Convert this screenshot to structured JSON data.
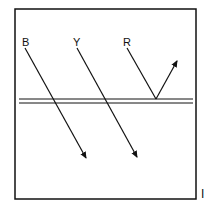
{
  "diagram": {
    "rays": [
      {
        "label": "B",
        "type": "transmitted"
      },
      {
        "label": "Y",
        "type": "transmitted"
      },
      {
        "label": "R",
        "type": "reflected"
      }
    ],
    "corner_mark": "I",
    "colors": {
      "stroke": "#111111",
      "background": "#ffffff"
    }
  }
}
